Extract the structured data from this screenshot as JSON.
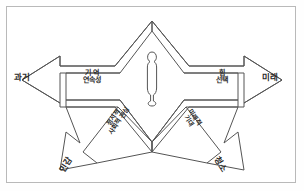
{
  "diagram": {
    "frame": {
      "border_color": "#b9b9b9",
      "background": "#ffffff"
    },
    "stroke_color": "#555555",
    "text_color": "#2b2b2b",
    "center_figure": {
      "name": "person-silhouette",
      "label": ""
    },
    "labels": {
      "left_outer": "과거",
      "right_outer": "미래",
      "upper_left_line1": "기 억",
      "upper_left_line2": "연속성",
      "upper_right_line1": "힘",
      "upper_right_line2": "선택",
      "diag_left_line1": "정서적",
      "diag_left_line2": "사회적 관심",
      "diag_right_line1": "미래적",
      "diag_right_line2": "기대",
      "bottom_left": "민감",
      "bottom_right": "청소"
    }
  }
}
